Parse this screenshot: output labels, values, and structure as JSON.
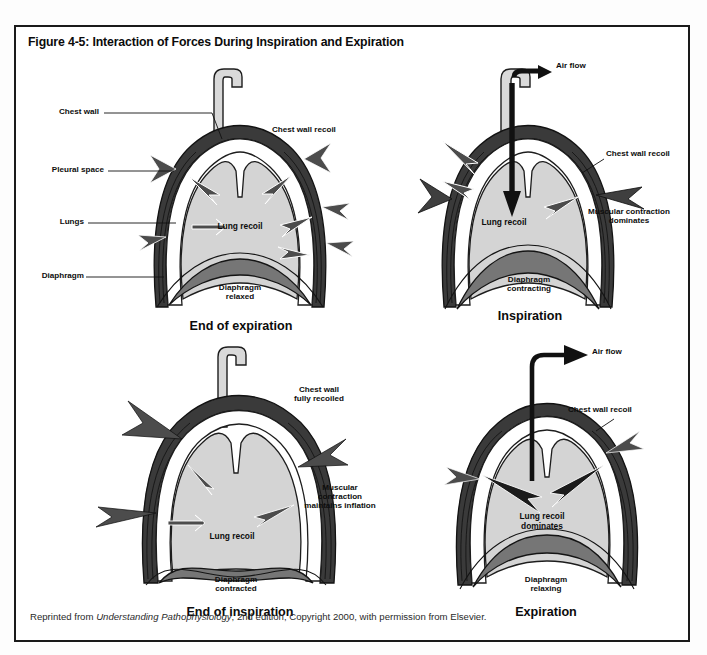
{
  "figure": {
    "title": "Figure 4-5: Interaction of Forces During Inspiration and Expiration",
    "caption_prefix": "Reprinted from ",
    "caption_italic": "Understanding Pathophysiology",
    "caption_suffix": ", 2nd edition, Copyright 2000, with permission from Elsevier."
  },
  "colors": {
    "lung_fill": "#d4d4d4",
    "diaphragm_fill": "#767676",
    "chest_wall": "#2b2b2b",
    "pleural_space": "#ffffff",
    "arrow_gray": "#4c4c4c",
    "arrow_black": "#111111",
    "frame": "#1a1a1a",
    "text": "#0b0b0b"
  },
  "panels": [
    {
      "id": "end-of-expiration",
      "title": "End of expiration",
      "anatomy_labels": [
        {
          "name": "chest-wall",
          "text": "Chest wall"
        },
        {
          "name": "pleural-space",
          "text": "Pleural space"
        },
        {
          "name": "lungs",
          "text": "Lungs"
        },
        {
          "name": "diaphragm",
          "text": "Diaphragm"
        }
      ],
      "force_labels": [
        {
          "name": "chest-wall-recoil",
          "text": "Chest wall recoil"
        },
        {
          "name": "lung-recoil",
          "text": "Lung recoil"
        }
      ],
      "state_label": {
        "name": "diaphragm-state",
        "line1": "Diaphragm",
        "line2": "relaxed"
      },
      "air_flow": "none"
    },
    {
      "id": "inspiration",
      "title": "Inspiration",
      "anatomy_labels": [],
      "force_labels": [
        {
          "name": "air-flow",
          "text": "Air flow"
        },
        {
          "name": "chest-wall-recoil",
          "text": "Chest wall recoil"
        },
        {
          "name": "lung-recoil",
          "text": "Lung recoil"
        },
        {
          "name": "muscular-contraction-dominates",
          "line1": "Muscular contraction",
          "line2": "dominates"
        }
      ],
      "state_label": {
        "name": "diaphragm-state",
        "line1": "Diaphragm",
        "line2": "contracting"
      },
      "air_flow": "inward"
    },
    {
      "id": "end-of-inspiration",
      "title": "End of inspiration",
      "anatomy_labels": [],
      "force_labels": [
        {
          "name": "chest-wall-fully-recoiled",
          "line1": "Chest wall",
          "line2": "fully recoiled"
        },
        {
          "name": "lung-recoil",
          "text": "Lung recoil"
        },
        {
          "name": "muscular-contraction-maintains-inflation",
          "line1": "Muscular",
          "line2": "contraction",
          "line3": "maintains inflation"
        }
      ],
      "state_label": {
        "name": "diaphragm-state",
        "line1": "Diaphragm",
        "line2": "contracted"
      },
      "air_flow": "none"
    },
    {
      "id": "expiration",
      "title": "Expiration",
      "anatomy_labels": [],
      "force_labels": [
        {
          "name": "air-flow",
          "text": "Air flow"
        },
        {
          "name": "chest-wall-recoil",
          "text": "Chest wall recoil"
        },
        {
          "name": "lung-recoil-dominates",
          "line1": "Lung recoil",
          "line2": "dominates"
        }
      ],
      "state_label": {
        "name": "diaphragm-state",
        "line1": "Diaphragm",
        "line2": "relaxing"
      },
      "air_flow": "outward"
    }
  ]
}
